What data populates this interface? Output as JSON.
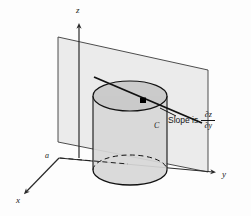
{
  "figure": {
    "type": "math-diagram",
    "background_color": "#fdfdfd",
    "axes": {
      "z_label": "z",
      "y_label": "y",
      "x_label": "x",
      "origin_label": "a"
    },
    "curve_label": "C",
    "annotation": {
      "text": "Slope is",
      "numerator": "∂z",
      "denominator": "∂y"
    },
    "colors": {
      "plane_fill": "#ebebeb",
      "plane_stroke": "#3a3a3a",
      "cylinder_fill": "#d8d8d8",
      "cylinder_top_fill": "#c9c9c9",
      "cylinder_stroke": "#111111",
      "line_stroke": "#111111",
      "axis_stroke": "#2a2a2a",
      "point_fill": "#000000"
    },
    "geometry": {
      "origin": [
        59,
        158
      ],
      "z_axis_tip": [
        79,
        22
      ],
      "y_axis_tip": [
        218,
        174
      ],
      "x_axis_tip": [
        22,
        196
      ],
      "plane_corners": [
        [
          58,
          37
        ],
        [
          208,
          70
        ],
        [
          208,
          172
        ],
        [
          58,
          142
        ]
      ],
      "cylinder_top_center": [
        130,
        96
      ],
      "cylinder_bottom_center": [
        130,
        170
      ],
      "cylinder_radius_x": 37,
      "cylinder_radius_y": 15,
      "tangent_line": [
        [
          94,
          77
        ],
        [
          202,
          123
        ]
      ],
      "tangent_point": [
        143,
        100
      ]
    }
  }
}
